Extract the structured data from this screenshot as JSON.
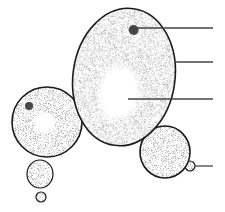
{
  "diagram": {
    "colors": {
      "background": "#ffffff",
      "outline": "#1a1a1a",
      "stipple": "#555555",
      "nucleus": "#2a2a2a",
      "leader_line": "#444444"
    },
    "cells": [
      {
        "id": "mother-cell",
        "cx": 124,
        "cy": 77,
        "rx": 51,
        "ry": 69,
        "rotate": 8,
        "vacuole": {
          "cx": 121,
          "cy": 93,
          "rx": 24,
          "ry": 32
        },
        "nucleus": {
          "cx": 127,
          "cy": 29,
          "r": 5
        }
      },
      {
        "id": "left-cell",
        "cx": 47,
        "cy": 122,
        "rx": 35,
        "ry": 35,
        "rotate": 0,
        "vacuole": {
          "cx": 45,
          "cy": 123,
          "rx": 12,
          "ry": 12
        },
        "nucleus": {
          "cx": 29,
          "cy": 106,
          "r": 4
        }
      },
      {
        "id": "left-bud",
        "cx": 40,
        "cy": 174,
        "rx": 13,
        "ry": 14,
        "rotate": 0
      },
      {
        "id": "left-small-bud",
        "cx": 41,
        "cy": 197,
        "rx": 5,
        "ry": 5,
        "rotate": 0
      },
      {
        "id": "right-cell",
        "cx": 165,
        "cy": 152,
        "rx": 25,
        "ry": 26,
        "rotate": 0
      },
      {
        "id": "right-bud",
        "cx": 190,
        "cy": 166,
        "rx": 5,
        "ry": 5,
        "rotate": 0
      }
    ],
    "leader_lines": [
      {
        "id": "label-line-nucleus",
        "x1": 133,
        "y1": 28,
        "x2": 213,
        "y2": 28
      },
      {
        "id": "label-line-cell-wall",
        "x1": 176,
        "y1": 62,
        "x2": 213,
        "y2": 62
      },
      {
        "id": "label-line-vacuole",
        "x1": 128,
        "y1": 99,
        "x2": 213,
        "y2": 99
      },
      {
        "id": "label-line-bud",
        "x1": 195,
        "y1": 166,
        "x2": 213,
        "y2": 166
      }
    ],
    "labels": []
  }
}
